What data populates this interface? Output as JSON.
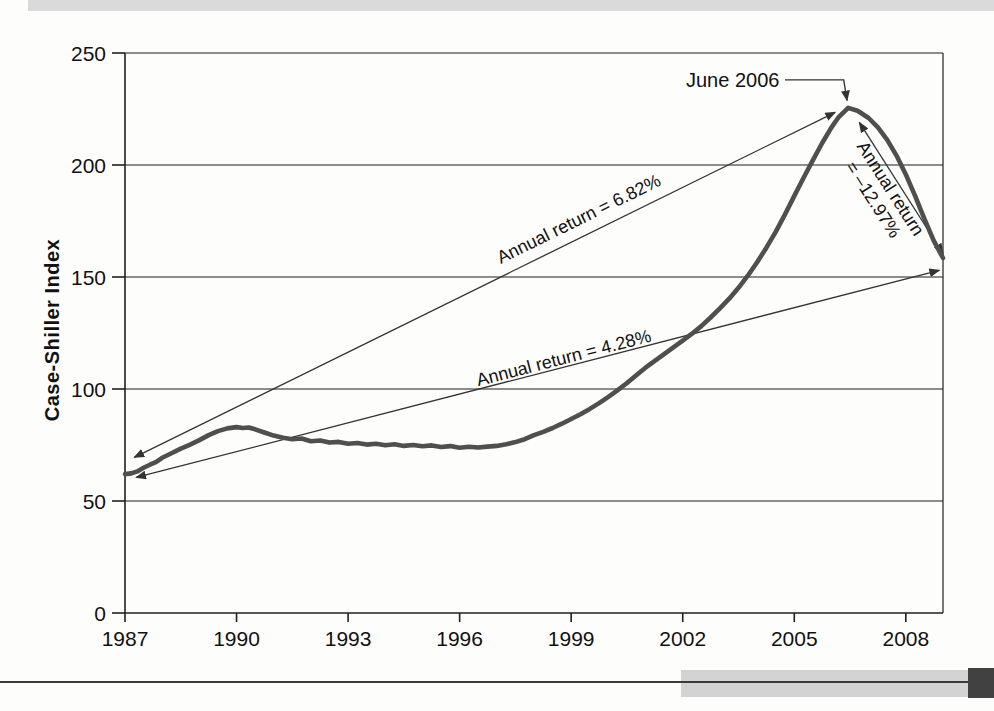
{
  "decor": {
    "top_bar_color": "#dadada",
    "bottom_rule_color": "#3b3b3b",
    "bottom_bar_color": "#d3d3d3",
    "corner_block_color": "#414141"
  },
  "chart_data": {
    "type": "line",
    "title": "",
    "xlabel": "",
    "ylabel": "Case-Shiller Index",
    "xlim": [
      1987,
      2009
    ],
    "ylim": [
      0,
      250
    ],
    "grid": "horizontal",
    "legend": "none",
    "xticks": {
      "values": [
        1987,
        1990,
        1993,
        1996,
        1999,
        2002,
        2005,
        2008
      ],
      "labels": [
        "1987",
        "1990",
        "1993",
        "1996",
        "1999",
        "2002",
        "2005",
        "2008"
      ]
    },
    "yticks": {
      "values": [
        0,
        50,
        100,
        150,
        200,
        250
      ],
      "labels": [
        "0",
        "50",
        "100",
        "150",
        "200",
        "250"
      ]
    },
    "colors": {
      "curve": "#4f4f4f",
      "axis": "#1f1f1f",
      "annotation": "#333333",
      "text": "#111111"
    },
    "series": [
      {
        "name": "Case-Shiller Index",
        "points": [
          [
            1987.0,
            62
          ],
          [
            1987.17,
            62.3
          ],
          [
            1987.33,
            63.2
          ],
          [
            1987.5,
            64.8
          ],
          [
            1987.67,
            66.2
          ],
          [
            1987.83,
            67.3
          ],
          [
            1988.0,
            69.3
          ],
          [
            1988.25,
            71.3
          ],
          [
            1988.5,
            73.4
          ],
          [
            1988.75,
            75.2
          ],
          [
            1989.0,
            77.2
          ],
          [
            1989.25,
            79.4
          ],
          [
            1989.5,
            81.2
          ],
          [
            1989.75,
            82.4
          ],
          [
            1990.0,
            83.0
          ],
          [
            1990.17,
            82.6
          ],
          [
            1990.33,
            82.8
          ],
          [
            1990.5,
            82.0
          ],
          [
            1990.75,
            80.6
          ],
          [
            1991.0,
            79.2
          ],
          [
            1991.25,
            78.2
          ],
          [
            1991.5,
            77.6
          ],
          [
            1991.75,
            77.9
          ],
          [
            1992.0,
            76.7
          ],
          [
            1992.25,
            77.0
          ],
          [
            1992.5,
            76.1
          ],
          [
            1992.75,
            76.4
          ],
          [
            1993.0,
            75.6
          ],
          [
            1993.25,
            75.9
          ],
          [
            1993.5,
            75.2
          ],
          [
            1993.75,
            75.6
          ],
          [
            1994.0,
            74.9
          ],
          [
            1994.25,
            75.3
          ],
          [
            1994.5,
            74.6
          ],
          [
            1994.75,
            75.0
          ],
          [
            1995.0,
            74.4
          ],
          [
            1995.25,
            74.8
          ],
          [
            1995.5,
            74.1
          ],
          [
            1995.75,
            74.5
          ],
          [
            1996.0,
            73.8
          ],
          [
            1996.25,
            74.2
          ],
          [
            1996.5,
            73.9
          ],
          [
            1996.75,
            74.3
          ],
          [
            1997.0,
            74.6
          ],
          [
            1997.25,
            75.3
          ],
          [
            1997.5,
            76.3
          ],
          [
            1997.75,
            77.6
          ],
          [
            1998.0,
            79.4
          ],
          [
            1998.25,
            80.9
          ],
          [
            1998.5,
            82.6
          ],
          [
            1998.75,
            84.5
          ],
          [
            1999.0,
            86.6
          ],
          [
            1999.25,
            88.7
          ],
          [
            1999.5,
            91.1
          ],
          [
            1999.75,
            93.7
          ],
          [
            2000.0,
            96.5
          ],
          [
            2000.25,
            99.5
          ],
          [
            2000.5,
            102.7
          ],
          [
            2000.75,
            106.1
          ],
          [
            2001.0,
            109.5
          ],
          [
            2001.25,
            112.6
          ],
          [
            2001.5,
            115.6
          ],
          [
            2001.75,
            118.6
          ],
          [
            2002.0,
            121.6
          ],
          [
            2002.25,
            124.7
          ],
          [
            2002.5,
            128.1
          ],
          [
            2002.75,
            131.9
          ],
          [
            2003.0,
            136.0
          ],
          [
            2003.25,
            140.3
          ],
          [
            2003.5,
            145.2
          ],
          [
            2003.75,
            150.6
          ],
          [
            2004.0,
            156.6
          ],
          [
            2004.25,
            163.1
          ],
          [
            2004.5,
            170.2
          ],
          [
            2004.75,
            178.0
          ],
          [
            2005.0,
            186.2
          ],
          [
            2005.25,
            194.3
          ],
          [
            2005.5,
            202.2
          ],
          [
            2005.75,
            209.8
          ],
          [
            2006.0,
            216.8
          ],
          [
            2006.2,
            221.5
          ],
          [
            2006.45,
            225.5
          ],
          [
            2006.7,
            224.2
          ],
          [
            2007.0,
            221.0
          ],
          [
            2007.25,
            216.8
          ],
          [
            2007.5,
            211.2
          ],
          [
            2007.75,
            204.2
          ],
          [
            2008.0,
            195.8
          ],
          [
            2008.25,
            186.2
          ],
          [
            2008.5,
            176.0
          ],
          [
            2008.75,
            166.2
          ],
          [
            2009.0,
            158.5
          ]
        ]
      }
    ],
    "annotations": {
      "arrows": [
        {
          "id": "return-682",
          "x1": 1987.25,
          "y1": 69.5,
          "x2": 2006.1,
          "y2": 223.5,
          "double": true
        },
        {
          "id": "return-428",
          "x1": 1987.3,
          "y1": 60.5,
          "x2": 2008.9,
          "y2": 153,
          "double": true
        },
        {
          "id": "return-1297",
          "x1": 2006.75,
          "y1": 219,
          "x2": 2009.0,
          "y2": 160.5,
          "double": true
        }
      ],
      "labels": [
        {
          "id": "annual-return-682",
          "lines": [
            "Annual return = 6.82%"
          ],
          "x": 1999.2,
          "y": 176,
          "align_arrow": "return-682"
        },
        {
          "id": "annual-return-428",
          "lines": [
            "Annual return = 4.28%"
          ],
          "x": 1998.8,
          "y": 114,
          "align_arrow": "return-428"
        },
        {
          "id": "annual-return-1297",
          "lines": [
            "Annual return",
            "= –12.97%"
          ],
          "x": 2007.35,
          "y": 187,
          "align_arrow": "return-1297"
        }
      ],
      "callout": {
        "id": "peak-callout",
        "text": "June 2006",
        "text_x": 2004.6,
        "text_y": 238,
        "path": [
          [
            2004.75,
            238
          ],
          [
            2006.33,
            238
          ],
          [
            2006.42,
            228.8
          ]
        ]
      }
    }
  }
}
